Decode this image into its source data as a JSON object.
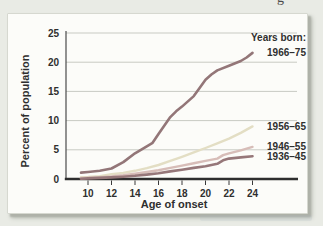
{
  "page": {
    "clipped_text_fragment": "g"
  },
  "chart_data": {
    "type": "line",
    "title": "",
    "xlabel": "Age of onset",
    "ylabel": "Percent of population",
    "legend_title": "Years born:",
    "xlim": [
      9.4,
      27.5
    ],
    "ylim": [
      0,
      25
    ],
    "x_ticks": [
      10,
      12,
      14,
      16,
      18,
      20,
      22,
      24
    ],
    "y_ticks": [
      0,
      5,
      10,
      15,
      20,
      25
    ],
    "grid": "horizontal gridlines at every 5 units",
    "legend_position": "right of line endpoints",
    "series": [
      {
        "name": "1966–75",
        "color": "#937678",
        "width": 2.6,
        "points": [
          [
            9.4,
            1.1
          ],
          [
            10,
            1.2
          ],
          [
            11,
            1.4
          ],
          [
            12,
            1.8
          ],
          [
            13,
            2.9
          ],
          [
            14,
            4.4
          ],
          [
            14.5,
            5.0
          ],
          [
            15,
            5.6
          ],
          [
            15.5,
            6.2
          ],
          [
            16,
            7.7
          ],
          [
            17,
            10.6
          ],
          [
            17.5,
            11.6
          ],
          [
            18,
            12.4
          ],
          [
            19,
            14.2
          ],
          [
            19.5,
            15.6
          ],
          [
            20,
            17.0
          ],
          [
            20.5,
            17.9
          ],
          [
            21,
            18.6
          ],
          [
            22,
            19.4
          ],
          [
            23,
            20.2
          ],
          [
            23.5,
            20.8
          ],
          [
            24,
            21.6
          ]
        ]
      },
      {
        "name": "1956–65",
        "color": "#e3dec4",
        "width": 2.4,
        "points": [
          [
            9.4,
            0.3
          ],
          [
            10,
            0.35
          ],
          [
            11,
            0.5
          ],
          [
            12,
            0.8
          ],
          [
            13,
            1.05
          ],
          [
            14,
            1.4
          ],
          [
            15,
            1.85
          ],
          [
            16,
            2.4
          ],
          [
            17,
            3.1
          ],
          [
            18,
            3.8
          ],
          [
            19,
            4.55
          ],
          [
            20,
            5.3
          ],
          [
            21,
            6.1
          ],
          [
            22,
            6.9
          ],
          [
            23,
            7.9
          ],
          [
            24,
            9.0
          ]
        ]
      },
      {
        "name": "1946–55",
        "color": "#d7bdb8",
        "width": 2.4,
        "points": [
          [
            9.4,
            0.15
          ],
          [
            10,
            0.2
          ],
          [
            11,
            0.3
          ],
          [
            12,
            0.45
          ],
          [
            13,
            0.65
          ],
          [
            14,
            0.9
          ],
          [
            15,
            1.2
          ],
          [
            16,
            1.5
          ],
          [
            17,
            1.9
          ],
          [
            18,
            2.3
          ],
          [
            19,
            2.7
          ],
          [
            20,
            3.1
          ],
          [
            21,
            3.5
          ],
          [
            21.5,
            4.1
          ],
          [
            22,
            4.4
          ],
          [
            23,
            4.9
          ],
          [
            24,
            5.5
          ]
        ]
      },
      {
        "name": "1936–45",
        "color": "#967779",
        "width": 2.6,
        "points": [
          [
            9.4,
            0.05
          ],
          [
            10,
            0.1
          ],
          [
            11,
            0.18
          ],
          [
            12,
            0.28
          ],
          [
            13,
            0.4
          ],
          [
            14,
            0.55
          ],
          [
            15,
            0.75
          ],
          [
            16,
            1.0
          ],
          [
            17,
            1.3
          ],
          [
            18,
            1.6
          ],
          [
            19,
            1.9
          ],
          [
            20,
            2.2
          ],
          [
            21,
            2.6
          ],
          [
            21.5,
            3.2
          ],
          [
            22,
            3.5
          ],
          [
            23,
            3.7
          ],
          [
            24,
            3.9
          ]
        ]
      }
    ],
    "style": {
      "page_background": "#e9ebe5",
      "figure_background": "#fcfcf9",
      "gridline_color": "#c8cac3",
      "axis_color": "#2e2e2e",
      "text_color": "#2f2f2f"
    }
  }
}
